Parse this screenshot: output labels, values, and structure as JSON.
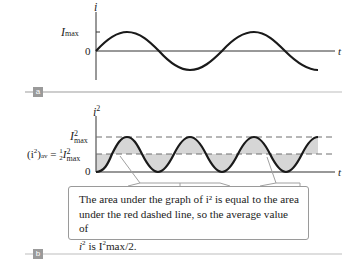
{
  "panel_a": {
    "badge": "a",
    "y_axis_label": "i",
    "x_axis_label": "t",
    "tick_max": "I",
    "tick_max_sub": "max",
    "tick_zero": "0"
  },
  "panel_b": {
    "badge": "b",
    "y_axis_label": "i",
    "y_axis_sup": "2",
    "x_axis_label": "t",
    "tick_max": "I",
    "tick_max_sup": "2",
    "tick_max_sub": "max",
    "tick_avg_left": "(i",
    "tick_avg_left_sup": "2",
    "tick_avg_paren": ")",
    "tick_avg_sub": "av",
    "tick_avg_eq": " = ",
    "tick_avg_frac_num": "1",
    "tick_avg_frac_den": "2",
    "tick_avg_I": "I",
    "tick_avg_I_sup": "2",
    "tick_avg_I_sub": "max",
    "tick_zero": "0"
  },
  "callout": {
    "text_line1": "The area under the graph of i² is equal to the area",
    "text_line2": "under the red dashed line, so the average value of",
    "text_line3_a": "i",
    "text_line3_sup1": "2",
    "text_line3_b": " is I",
    "text_line3_sup2": "2",
    "text_line3_c": "max/2."
  },
  "colors": {
    "curve": "#1a1a1a",
    "axis": "#333333",
    "dashed": "#6e6e6e",
    "fill": "#d6d6d6",
    "separator": "#bdbdbd",
    "badge": "#9a9a9a"
  }
}
